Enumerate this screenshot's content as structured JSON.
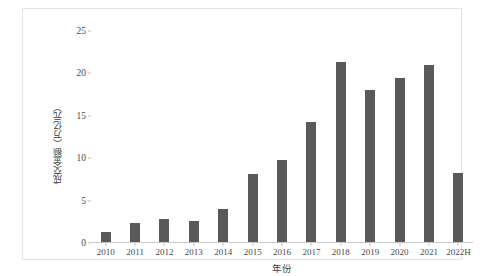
{
  "chart_data": {
    "type": "bar",
    "title": "",
    "xlabel": "年份",
    "ylabel": "成交金额（万亿元）",
    "categories": [
      "2010",
      "2011",
      "2012",
      "2013",
      "2014",
      "2015",
      "2016",
      "2017",
      "2018",
      "2019",
      "2020",
      "2021",
      "2022H"
    ],
    "values": [
      1.3,
      2.4,
      2.8,
      2.6,
      4.0,
      8.1,
      9.8,
      14.3,
      21.4,
      18.1,
      19.5,
      21.0,
      8.2
    ],
    "yticks": [
      0,
      5,
      10,
      15,
      20,
      25
    ],
    "ytick_labels": [
      "0",
      "5",
      "10",
      "15",
      "20",
      "25"
    ],
    "ylim": [
      0,
      25
    ],
    "grid": false,
    "legend": false,
    "bar_color": "#595959",
    "frame_color": "#e3e3e3",
    "axis_color": "#c8c8c8"
  }
}
